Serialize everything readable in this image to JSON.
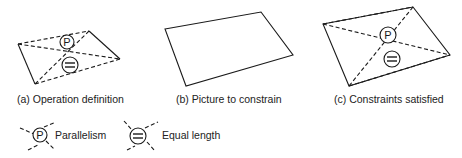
{
  "panels": [
    {
      "id": "a",
      "caption": "(a) Operation definition"
    },
    {
      "id": "b",
      "caption": "(b) Picture to constrain"
    },
    {
      "id": "c",
      "caption": "(c) Constraints satisfied"
    }
  ],
  "symbols": {
    "parallel_glyph": "P",
    "equal_glyph": "="
  },
  "legend": [
    {
      "symbol": "P",
      "label": "Parallelism"
    },
    {
      "symbol": "=",
      "label": "Equal length"
    }
  ],
  "colors": {
    "ink": "#1a1a1a",
    "background": "#ffffff"
  }
}
